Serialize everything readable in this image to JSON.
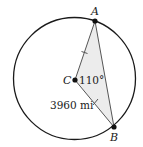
{
  "diagram": {
    "type": "circle-central-angle",
    "points": {
      "A": {
        "label": "A",
        "x": 95,
        "y": 21
      },
      "B": {
        "label": "B",
        "x": 114,
        "y": 127
      },
      "C": {
        "label": "C",
        "x": 75,
        "y": 80
      }
    },
    "circle": {
      "cx": 74.5,
      "cy": 78.5,
      "r": 61
    },
    "angle_label": "110°",
    "radius_label": "3960 mi",
    "colors": {
      "stroke": "#1a1a1a",
      "chord": "#555555",
      "fill": "#ececec"
    }
  }
}
